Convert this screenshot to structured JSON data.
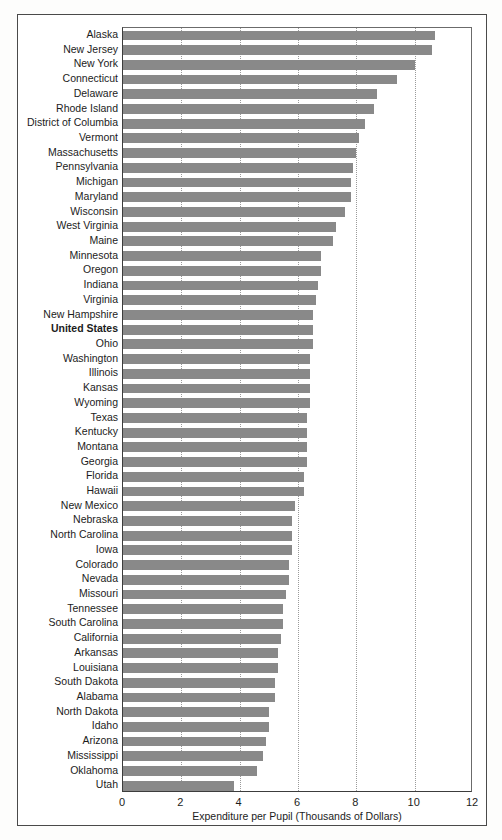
{
  "chart_data": {
    "type": "bar",
    "orientation": "horizontal",
    "title": "",
    "subtitle": "",
    "xlabel": "Expenditure per Pupil (Thousands of Dollars)",
    "ylabel": "",
    "xlim": [
      0,
      12
    ],
    "xticks": [
      0,
      2,
      4,
      6,
      8,
      10,
      12
    ],
    "grid": "vertical-dotted",
    "legend": "none",
    "bar_color": "#898989",
    "highlight_category": "United States",
    "units": "Thousands of Dollars",
    "categories": [
      "Alaska",
      "New Jersey",
      "New York",
      "Connecticut",
      "Delaware",
      "Rhode Island",
      "District of Columbia",
      "Vermont",
      "Massachusetts",
      "Pennsylvania",
      "Michigan",
      "Maryland",
      "Wisconsin",
      "West Virginia",
      "Maine",
      "Minnesota",
      "Oregon",
      "Indiana",
      "Virginia",
      "New Hampshire",
      "United States",
      "Ohio",
      "Washington",
      "Illinois",
      "Kansas",
      "Wyoming",
      "Texas",
      "Kentucky",
      "Montana",
      "Georgia",
      "Florida",
      "Hawaii",
      "New Mexico",
      "Nebraska",
      "North Carolina",
      "Iowa",
      "Colorado",
      "Nevada",
      "Missouri",
      "Tennessee",
      "South Carolina",
      "California",
      "Arkansas",
      "Louisiana",
      "South Dakota",
      "Alabama",
      "North Dakota",
      "Idaho",
      "Arizona",
      "Mississippi",
      "Oklahoma",
      "Utah"
    ],
    "values": [
      10.7,
      10.6,
      10.0,
      9.4,
      8.7,
      8.6,
      8.3,
      8.1,
      8.0,
      7.9,
      7.8,
      7.8,
      7.6,
      7.3,
      7.2,
      6.8,
      6.8,
      6.7,
      6.6,
      6.5,
      6.5,
      6.5,
      6.4,
      6.4,
      6.4,
      6.4,
      6.3,
      6.3,
      6.3,
      6.3,
      6.2,
      6.2,
      5.9,
      5.8,
      5.8,
      5.8,
      5.7,
      5.7,
      5.6,
      5.5,
      5.5,
      5.4,
      5.3,
      5.3,
      5.2,
      5.2,
      5.0,
      5.0,
      4.9,
      4.8,
      4.6,
      3.8
    ]
  }
}
